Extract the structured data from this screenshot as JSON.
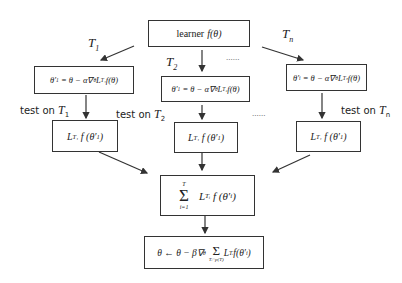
{
  "diagram": {
    "learner": {
      "label": "learner",
      "func": "f(θ)"
    },
    "task_labels": {
      "t1": {
        "main": "T",
        "sub": "1"
      },
      "t2": {
        "main": "T",
        "sub": "2"
      },
      "tn": {
        "main": "T",
        "sub": "n"
      }
    },
    "ellipsis": "......",
    "updates": {
      "t1": "θ′₁ = θ − α∇θ L_{T₁} f(θ)",
      "t2": "θ′₁ = θ − α∇θ L_{T₂} f(θ)",
      "tn": "θ′ᵢ = θ − α∇θ L_{Tₙ} f(θ)"
    },
    "update_parts": {
      "lhs_t1": "θ′",
      "lhs_t1_sub": "1",
      "lhs_t2": "θ′",
      "lhs_t2_sub": "1",
      "lhs_tn": "θ′",
      "lhs_tn_sub": "i",
      "rhs": "= θ − α∇",
      "grad_sub": "θ",
      "loss": "L",
      "loss_sub_t1": "T₁",
      "loss_sub_t2": "T₂",
      "loss_sub_tn": "Tₙ",
      "tail": "f(θ)"
    },
    "tests": {
      "t1": {
        "prefix": "test on",
        "main": "T",
        "sub": "1"
      },
      "t2": {
        "prefix": "test on",
        "main": "T",
        "sub": "2"
      },
      "tn": {
        "prefix": "test on",
        "main": "T",
        "sub": "n"
      }
    },
    "test_loss": {
      "loss": "L",
      "loss_sub": "T₁",
      "tail": "f (θ′",
      "theta_sub": "1",
      "close": ")"
    },
    "aggregate": {
      "sum_symbol": "Σ",
      "upper": "T",
      "lower": "i=1",
      "loss": "L",
      "loss_sub": "Tᵢ",
      "tail": "f (θ′",
      "theta_sub": "i",
      "close": ")"
    },
    "meta_update": {
      "lhs": "θ ← θ − β∇",
      "grad_sub": "θ",
      "sum_symbol": "Σ",
      "sum_lower": "Tᵢ~p(T)",
      "loss": "L",
      "loss_sub": "Tᵢ",
      "tail": "f(θ′",
      "theta_sub": "i",
      "close": ")"
    }
  }
}
